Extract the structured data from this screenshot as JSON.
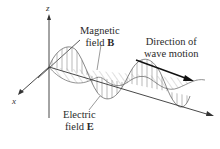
{
  "diagram": {
    "axes": {
      "z": "z",
      "x": "x"
    },
    "labels": {
      "magnetic_line1": "Magnetic",
      "magnetic_line2_prefix": "field ",
      "magnetic_symbol": "B",
      "electric_line1": "Electric",
      "electric_line2_prefix": "field ",
      "electric_symbol": "E",
      "direction_line1": "Direction of",
      "direction_line2": "wave motion"
    },
    "colors": {
      "line": "#333333",
      "hatch": "#8a8a8a",
      "background": "#ffffff"
    }
  }
}
